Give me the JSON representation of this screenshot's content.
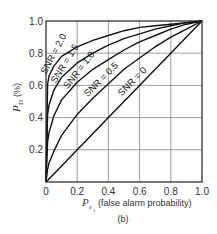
{
  "chart_data": {
    "type": "line",
    "title": "",
    "caption": "(b)",
    "xlabel": {
      "symbol": "P",
      "subscript": "ε",
      "subsubscript": "1",
      "text": "(false alarm probability)"
    },
    "ylabel": {
      "symbol": "P",
      "subscript": "D",
      "text": "(%)"
    },
    "xlim": [
      0,
      1.0
    ],
    "ylim": [
      0,
      1.0
    ],
    "grid": true,
    "legend": "inline-labels",
    "xticks": [
      "0",
      "0.2",
      "0.4",
      "0.6",
      "0.8",
      "1.0"
    ],
    "yticks": [
      "0",
      "0.2",
      "0.4",
      "0.6",
      "0.8",
      "1.0"
    ],
    "x": [
      0,
      0.01,
      0.02,
      0.05,
      0.1,
      0.2,
      0.3,
      0.4,
      0.5,
      0.6,
      0.7,
      0.8,
      0.9,
      1.0
    ],
    "series": [
      {
        "name": "SNR = 2.0",
        "values": [
          0,
          0.61,
          0.66,
          0.72,
          0.78,
          0.84,
          0.88,
          0.91,
          0.94,
          0.96,
          0.97,
          0.98,
          0.99,
          1.0
        ]
      },
      {
        "name": "SNR = 1.5",
        "values": [
          0,
          0.42,
          0.48,
          0.57,
          0.65,
          0.74,
          0.8,
          0.85,
          0.89,
          0.92,
          0.95,
          0.97,
          0.99,
          1.0
        ]
      },
      {
        "name": "SNR = 1.0",
        "values": [
          0,
          0.25,
          0.31,
          0.41,
          0.51,
          0.62,
          0.7,
          0.76,
          0.82,
          0.87,
          0.91,
          0.95,
          0.98,
          1.0
        ]
      },
      {
        "name": "SNR = 0.5",
        "values": [
          0,
          0.08,
          0.12,
          0.19,
          0.29,
          0.42,
          0.52,
          0.61,
          0.7,
          0.77,
          0.84,
          0.9,
          0.95,
          1.0
        ]
      },
      {
        "name": "SNR = 0",
        "values": [
          0,
          0.01,
          0.02,
          0.05,
          0.1,
          0.2,
          0.3,
          0.4,
          0.5,
          0.6,
          0.7,
          0.8,
          0.9,
          1.0
        ]
      }
    ]
  }
}
